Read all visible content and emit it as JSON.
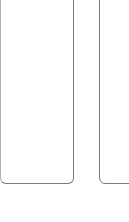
{
  "panels": [
    {
      "id": "left",
      "content": ""
    },
    {
      "id": "right",
      "content": ""
    }
  ]
}
